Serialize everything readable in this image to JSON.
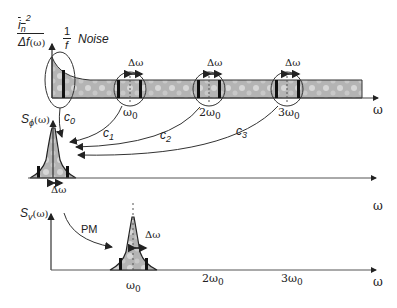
{
  "diagram": {
    "top_panel": {
      "y_label": {
        "num": "i",
        "num_sub": "n",
        "num_sup": "2",
        "den": "Δf",
        "arg": "(ω)"
      },
      "noise_label": {
        "frac_num": "1",
        "frac_den": "f",
        "text": "Noise"
      },
      "x_label": "ω",
      "harmonics": [
        {
          "label": "ω",
          "sub": "0",
          "bandwidth": "Δω"
        },
        {
          "label": "2ω",
          "sub": "0",
          "bandwidth": "Δω"
        },
        {
          "label": "3ω",
          "sub": "0",
          "bandwidth": "Δω"
        }
      ]
    },
    "coefficients": [
      "c",
      "c",
      "c",
      "c"
    ],
    "coefficient_subs": [
      "0",
      "1",
      "2",
      "3"
    ],
    "middle_panel": {
      "y_label": {
        "base": "S",
        "sub": "ϕ",
        "arg": "(ω)"
      },
      "bandwidth": "Δω",
      "x_label": "ω"
    },
    "bottom_panel": {
      "y_label": {
        "base": "S",
        "sub": "v",
        "arg": "(ω)"
      },
      "conversion": "PM",
      "bandwidth": "Δω",
      "x_ticks": [
        {
          "label": "ω",
          "sub": "0"
        },
        {
          "label": "2ω",
          "sub": "0"
        },
        {
          "label": "3ω",
          "sub": "0"
        }
      ],
      "x_label": "ω"
    },
    "colors": {
      "axis": "#444444",
      "band": "#b8b8b8",
      "band_dark": "#1a1a1a",
      "circle": "#333333"
    }
  }
}
